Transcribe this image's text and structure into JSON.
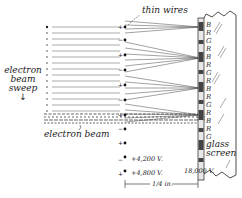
{
  "figure": {
    "labels": {
      "thin_wires": "thin wires",
      "electron_beam_sweep": [
        "electron",
        "beam",
        "sweep"
      ],
      "electron_beam": "electron beam",
      "glass_screen": [
        "glass",
        "screen"
      ],
      "screen_voltage": "18,000 V.",
      "voltage_minus": "+4,200 V.",
      "voltage_plus": "+4,800 V.",
      "scale_label": "1/4 in."
    },
    "legend_signs": {
      "minus_sign": "−",
      "plus_sign": "+"
    },
    "color_strips": [
      "B",
      "R",
      "G",
      "R",
      "B",
      "R",
      "G",
      "R",
      "B",
      "R",
      "G",
      "R",
      "B",
      "R",
      "G"
    ],
    "wire_signs": [
      "+",
      "−",
      "+",
      "−",
      "+",
      "−",
      "+",
      "−",
      "+"
    ],
    "colors": {
      "ink": "#222222",
      "background": "#ffffff"
    }
  }
}
